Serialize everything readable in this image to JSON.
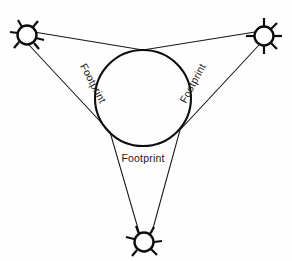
{
  "diagram": {
    "background_color": "#fefefe",
    "stroke_color": "#0d0d0d",
    "width": 292,
    "height": 261,
    "nodes": [
      {
        "id": "node-top-left",
        "name": "satellite-top-left",
        "cx": 27,
        "cy": 35,
        "r": 9.5,
        "spike_angles_deg": [
          -120,
          -60,
          20,
          60,
          150,
          200
        ],
        "spike_length": 7
      },
      {
        "id": "node-top-right",
        "name": "satellite-top-right",
        "cx": 264,
        "cy": 36,
        "r": 9.5,
        "spike_angles_deg": [
          0,
          90,
          180,
          270,
          45,
          135
        ],
        "spike_length": 7
      },
      {
        "id": "node-bottom",
        "name": "satellite-bottom",
        "cx": 144,
        "cy": 242,
        "r": 9.5,
        "spike_angles_deg": [
          -110,
          -70,
          0,
          40,
          140,
          190
        ],
        "spike_length": 7
      }
    ],
    "footprint": {
      "name": "footprint-circle",
      "cx": 143,
      "cy": 98,
      "r": 48
    },
    "labels": [
      {
        "id": "label-left",
        "text": "Footprint",
        "x": 90,
        "y": 85,
        "rotation_deg": 62
      },
      {
        "id": "label-right",
        "text": "Footprint",
        "x": 196,
        "y": 85,
        "rotation_deg": -62
      },
      {
        "id": "label-bottom",
        "text": "Footprint",
        "x": 143,
        "y": 162,
        "rotation_deg": 0
      }
    ],
    "beams": [
      {
        "id": "beam-tl-to-tr",
        "from": "node-top-left",
        "to": "node-top-right",
        "description": "upper tangent chord touching footprint top"
      },
      {
        "id": "beam-tl-to-bottom",
        "from": "node-top-left",
        "to": "node-bottom",
        "description": "left tangent chord touching footprint lower-left"
      },
      {
        "id": "beam-tr-to-bottom",
        "from": "node-top-right",
        "to": "node-bottom",
        "description": "right tangent chord touching footprint lower-right"
      }
    ]
  }
}
